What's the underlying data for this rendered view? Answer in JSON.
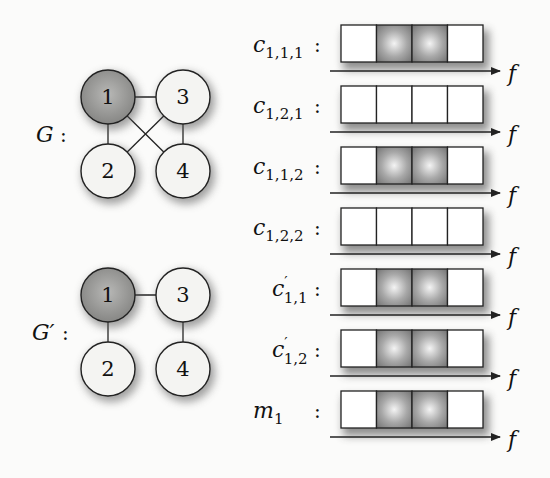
{
  "graphs": [
    {
      "label": "G",
      "label_suffix": ":",
      "nodes": [
        {
          "id": "1",
          "highlighted": true
        },
        {
          "id": "2",
          "highlighted": false
        },
        {
          "id": "3",
          "highlighted": false
        },
        {
          "id": "4",
          "highlighted": false
        }
      ],
      "edges": [
        [
          "1",
          "3"
        ],
        [
          "1",
          "2"
        ],
        [
          "3",
          "4"
        ],
        [
          "1",
          "4"
        ],
        [
          "3",
          "2"
        ]
      ]
    },
    {
      "label": "G′",
      "label_suffix": ":",
      "nodes": [
        {
          "id": "1",
          "highlighted": true
        },
        {
          "id": "2",
          "highlighted": false
        },
        {
          "id": "3",
          "highlighted": false
        },
        {
          "id": "4",
          "highlighted": false
        }
      ],
      "edges": [
        [
          "1",
          "3"
        ],
        [
          "1",
          "2"
        ],
        [
          "3",
          "4"
        ]
      ]
    }
  ],
  "rows": [
    {
      "base": "c",
      "prime": "",
      "sub": "1,1,1",
      "cells": [
        0,
        1,
        1,
        0
      ]
    },
    {
      "base": "c",
      "prime": "",
      "sub": "1,2,1",
      "cells": [
        0,
        0,
        0,
        0
      ]
    },
    {
      "base": "c",
      "prime": "",
      "sub": "1,1,2",
      "cells": [
        0,
        1,
        1,
        0
      ]
    },
    {
      "base": "c",
      "prime": "",
      "sub": "1,2,2",
      "cells": [
        0,
        0,
        0,
        0
      ]
    },
    {
      "base": "c",
      "prime": "′",
      "sub": "1,1",
      "cells": [
        0,
        1,
        1,
        0
      ]
    },
    {
      "base": "c",
      "prime": "′",
      "sub": "1,2",
      "cells": [
        0,
        1,
        1,
        0
      ]
    },
    {
      "base": "m",
      "prime": "",
      "sub": "1",
      "cells": [
        0,
        1,
        1,
        0
      ]
    }
  ],
  "axis_label": "f",
  "row_suffix": ":",
  "colors": {
    "node_fill": "#f4f4f2",
    "node_highlight": "#9a9a98",
    "cell_active_center": "#f2f2f2",
    "cell_active_edge": "#7a7a7a",
    "stroke": "#222222"
  }
}
